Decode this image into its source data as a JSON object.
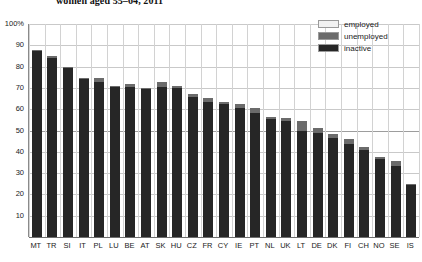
{
  "chart_data": {
    "type": "bar",
    "title": "women aged 55–64, 2011",
    "title_partial_above": "",
    "xlabel": "",
    "ylabel": "",
    "ylim": [
      0,
      100
    ],
    "yticks": [
      "100%",
      "90",
      "80",
      "70",
      "60",
      "50",
      "40",
      "30",
      "20",
      "10"
    ],
    "ytick_values": [
      100,
      90,
      80,
      70,
      60,
      50,
      40,
      30,
      20,
      10
    ],
    "grid": true,
    "legend_position": "top-right",
    "stacked": true,
    "categories": [
      "MT",
      "TR",
      "SI",
      "IT",
      "PL",
      "LU",
      "BE",
      "AT",
      "SK",
      "HU",
      "CZ",
      "FR",
      "CY",
      "IE",
      "PT",
      "NL",
      "UK",
      "LT",
      "DE",
      "DK",
      "FI",
      "CH",
      "NO",
      "SE",
      "IS"
    ],
    "series": [
      {
        "name": "inactive",
        "color": "#262626",
        "values": [
          87.5,
          84.2,
          79.3,
          74.2,
          73.0,
          70.4,
          70.2,
          69.5,
          70.4,
          69.8,
          65.6,
          63.4,
          62.4,
          60.4,
          58.4,
          55.2,
          54.4,
          50.0,
          49.0,
          46.4,
          43.6,
          41.0,
          36.6,
          33.4,
          24.2
        ]
      },
      {
        "name": "unemployed",
        "color": "#6b6b6b",
        "values": [
          0.5,
          0.6,
          0.7,
          0.4,
          1.6,
          0.5,
          1.5,
          0.4,
          2.3,
          1.3,
          1.5,
          1.8,
          1.1,
          1.9,
          2.4,
          1.1,
          1.5,
          4.6,
          2.3,
          2.0,
          2.2,
          1.2,
          0.8,
          2.2,
          0.6
        ]
      }
    ],
    "totals": [
      88.0,
      84.8,
      80.0,
      74.6,
      74.6,
      70.9,
      71.7,
      69.9,
      72.7,
      71.1,
      67.1,
      65.2,
      63.5,
      62.3,
      60.8,
      56.3,
      55.9,
      54.6,
      51.3,
      48.4,
      45.8,
      42.2,
      37.4,
      35.6,
      24.8
    ],
    "legend": [
      {
        "label": "employed",
        "color": "#f2f2f2"
      },
      {
        "label": "unemployed",
        "color": "#6b6b6b"
      },
      {
        "label": "inactive",
        "color": "#262626"
      }
    ]
  }
}
